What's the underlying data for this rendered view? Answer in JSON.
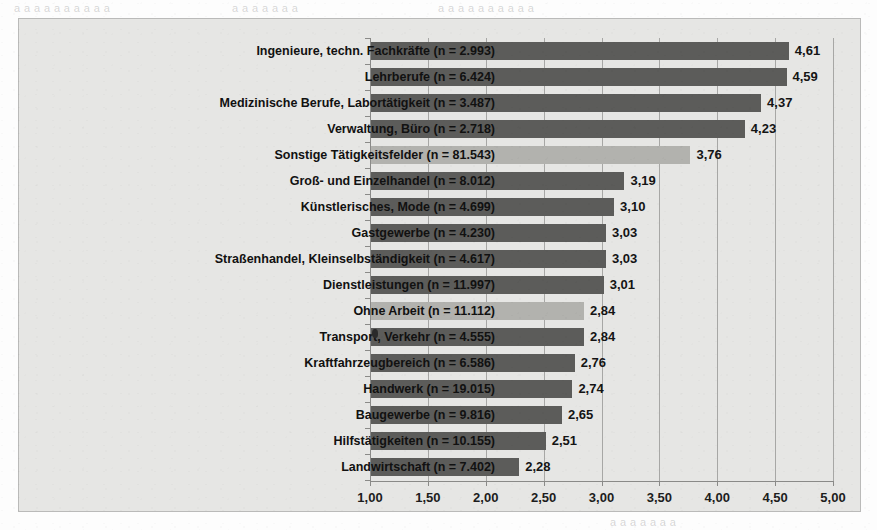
{
  "page": {
    "bleed_text_1": "a a a a a  a  a a a a",
    "bleed_text_2": "a  a a  a a a  a",
    "bleed_text_3": "a a a  a a a a a a a",
    "bleed_text_4": "a a  a a a a a"
  },
  "colors": {
    "panel_background": "#e6e6e4",
    "bar_default": "#5c5c5a",
    "bar_highlight": "#b2b2ae",
    "axis": "#8a8a88",
    "text": "#111111"
  },
  "chart_data": {
    "type": "bar",
    "orientation": "horizontal",
    "title": "",
    "xlabel": "",
    "ylabel": "",
    "xlim": [
      1.0,
      5.0
    ],
    "xticks": [
      1.0,
      1.5,
      2.0,
      2.5,
      3.0,
      3.5,
      4.0,
      4.5,
      5.0
    ],
    "xticklabels": [
      "1,00",
      "1,50",
      "2,00",
      "2,50",
      "3,00",
      "3,50",
      "4,00",
      "4,50",
      "5,00"
    ],
    "grid": true,
    "legend": null,
    "categories": [
      "Ingenieure, techn. Fachkräfte (n = 2.993)",
      "Lehrberufe (n = 6.424)",
      "Medizinische Berufe, Labortätigkeit (n = 3.487)",
      "Verwaltung, Büro (n = 2.718)",
      "Sonstige Tätigkeitsfelder (n = 81.543)",
      "Groß- und Einzelhandel (n = 8.012)",
      "Künstlerisches, Mode (n = 4.699)",
      "Gastgewerbe (n = 4.230)",
      "Straßenhandel, Kleinselbständigkeit (n = 4.617)",
      "Dienstleistungen (n = 11.997)",
      "Ohne Arbeit (n = 11.112)",
      "Transport, Verkehr (n = 4.555)",
      "Kraftfahrzeugbereich (n = 6.586)",
      "Handwerk (n = 19.015)",
      "Baugewerbe (n = 9.816)",
      "Hilfstätigkeiten (n = 10.155)",
      "Landwirtschaft (n = 7.402)"
    ],
    "values": [
      4.61,
      4.59,
      4.37,
      4.23,
      3.76,
      3.19,
      3.1,
      3.03,
      3.03,
      3.01,
      2.84,
      2.84,
      2.76,
      2.74,
      2.65,
      2.51,
      2.28
    ],
    "value_labels": [
      "4,61",
      "4,59",
      "4,37",
      "4,23",
      "3,76",
      "3,19",
      "3,10",
      "3,03",
      "3,03",
      "3,01",
      "2,84",
      "2,84",
      "2,76",
      "2,74",
      "2,65",
      "2,51",
      "2,28"
    ],
    "highlighted": [
      false,
      false,
      false,
      false,
      true,
      false,
      false,
      false,
      false,
      false,
      true,
      false,
      false,
      false,
      false,
      false,
      false
    ]
  }
}
